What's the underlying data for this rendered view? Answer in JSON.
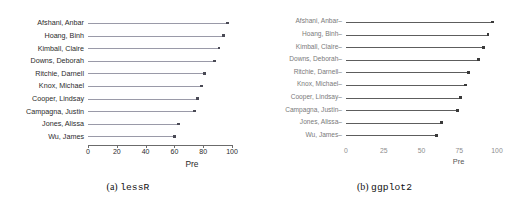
{
  "figure": {
    "panels": [
      {
        "id": "panel-a",
        "caption_number": "(a)",
        "caption_name": "lessR",
        "axis_title": "Pre",
        "ticks": [
          "0",
          "20",
          "40",
          "60",
          "80",
          "100"
        ]
      },
      {
        "id": "panel-b",
        "caption_number": "(b)",
        "caption_name": "ggplot2",
        "axis_title": "Pre",
        "ticks": [
          "0",
          "25",
          "50",
          "75",
          "100"
        ]
      }
    ]
  },
  "chart_data": {
    "type": "bar",
    "subtype": "lollipop-dot-plot",
    "title": "",
    "xlabel": "Pre",
    "ylabel": "",
    "orientation": "horizontal",
    "grid": false,
    "legend": false,
    "categories": [
      "Afshani, Anbar",
      "Hoang, Binh",
      "Kimball, Claire",
      "Downs, Deborah",
      "Ritchie, Darnell",
      "Knox, Michael",
      "Cooper, Lindsay",
      "Campagna, Justin",
      "Jones, Alissa",
      "Wu, James"
    ],
    "values": [
      97,
      94,
      91,
      88,
      81,
      79,
      76,
      74,
      63,
      60
    ],
    "panel_a": {
      "xlim": [
        0,
        100
      ],
      "xticks": [
        0,
        20,
        40,
        60,
        80,
        100
      ],
      "xlabel": "Pre",
      "caption": "(a) lessR"
    },
    "panel_b": {
      "xlim": [
        0,
        100
      ],
      "xticks": [
        0,
        25,
        50,
        75,
        100
      ],
      "xlabel": "Pre",
      "caption": "(b) ggplot2"
    },
    "colors": {
      "line_a": "#9a9aa8",
      "dot_a": "#4a4a55",
      "line_b": "#5d5d5d",
      "dot_b": "#3a3a3a",
      "label_a": "#2b2b2b",
      "label_b": "#7a7a7a",
      "axis": "#6b6b6b",
      "background": "#ffffff"
    }
  },
  "layout": {
    "panel_a": {
      "plot_left": 88,
      "plot_right": 232,
      "label_right": 84,
      "row_top": 23,
      "row_step": 12.6,
      "axis_y": 145,
      "tick_label_y": 148,
      "axis_title_y": 160,
      "caption_y": 182
    },
    "panel_b": {
      "plot_left": 90,
      "plot_right": 241,
      "label_right": 86,
      "row_top": 22,
      "row_step": 12.6,
      "axis_y": 146,
      "tick_label_y": 148,
      "axis_title_y": 158,
      "caption_y": 182
    }
  }
}
